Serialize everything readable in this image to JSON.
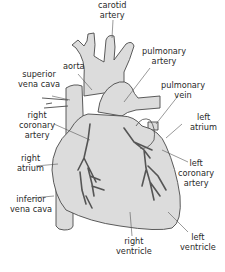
{
  "colors": {
    "tissue": "#dcdcdc",
    "outline": "#4a4a4a",
    "vessel": "#555555",
    "leader": "#555555",
    "background": "#ffffff"
  },
  "labels": {
    "carotid_artery": [
      "carotid",
      "artery"
    ],
    "aorta": [
      "aorta"
    ],
    "pulmonary_artery": [
      "pulmonary",
      "artery"
    ],
    "superior_vena_cava": [
      "superior",
      "vena cava"
    ],
    "pulmonary_vein": [
      "pulmonary",
      "vein"
    ],
    "right_coronary_artery": [
      "right",
      "coronary",
      "artery"
    ],
    "left_atrium": [
      "left",
      "atrium"
    ],
    "right_atrium": [
      "right",
      "atrium"
    ],
    "left_coronary_artery": [
      "left",
      "coronary",
      "artery"
    ],
    "inferior_vena_cava": [
      "inferior",
      "vena cava"
    ],
    "right_ventricle": [
      "right",
      "ventricle"
    ],
    "left_ventricle": [
      "left",
      "ventricle"
    ]
  }
}
